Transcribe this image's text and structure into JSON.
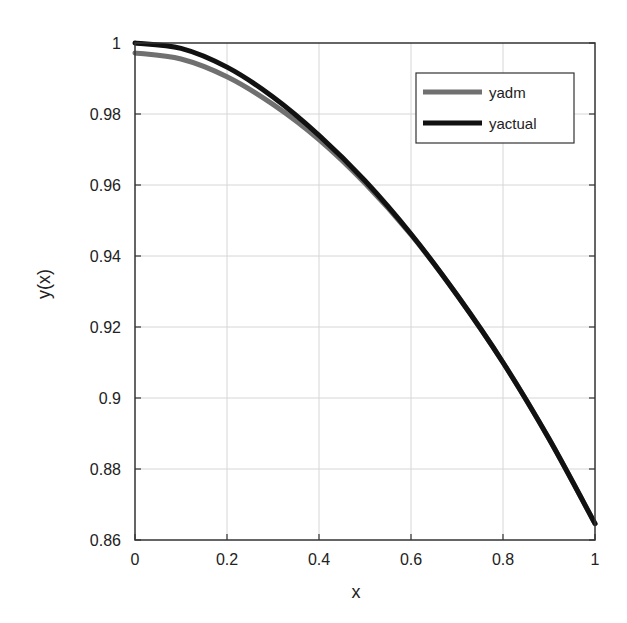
{
  "chart_data": {
    "type": "line",
    "title": "",
    "xlabel": "x",
    "ylabel": "y(x)",
    "xlim": [
      0,
      1
    ],
    "ylim": [
      0.86,
      1.0
    ],
    "grid": true,
    "legend_position": "upper right",
    "x_ticks": [
      "0",
      "0.2",
      "0.4",
      "0.6",
      "0.8",
      "1"
    ],
    "y_ticks": [
      "0.86",
      "0.88",
      "0.9",
      "0.92",
      "0.94",
      "0.96",
      "0.98",
      "1"
    ],
    "x": [
      0,
      0.1,
      0.2,
      0.3,
      0.4,
      0.5,
      0.6,
      0.7,
      0.8,
      0.9,
      1.0
    ],
    "series": [
      {
        "name": "yadm",
        "color": "#707070",
        "values": [
          0.9972,
          0.9955,
          0.9905,
          0.9827,
          0.9728,
          0.9605,
          0.946,
          0.929,
          0.91,
          0.8885,
          0.8646
        ]
      },
      {
        "name": "yactual",
        "color": "#111111",
        "values": [
          1.0,
          0.9985,
          0.9932,
          0.9848,
          0.974,
          0.9612,
          0.9462,
          0.929,
          0.91,
          0.8885,
          0.8646
        ]
      }
    ]
  }
}
